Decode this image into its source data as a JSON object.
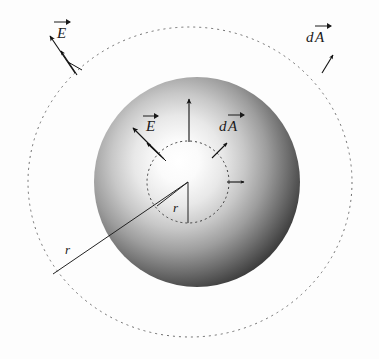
{
  "figure": {
    "type": "physics-diagram",
    "background_color": "#fdfdfd"
  },
  "labels": {
    "outer_E": "E",
    "outer_dA_d": "d",
    "outer_dA_A": "A",
    "inner_E": "E",
    "inner_dA_d": "d",
    "inner_dA_A": "A",
    "inner_radius": "r",
    "outer_radius": "r"
  },
  "shapes": {
    "charged_sphere": {
      "name": "charged-sphere",
      "center_x": 197,
      "center_y": 182,
      "radius_x": 103,
      "radius_y": 105,
      "fill_center_color": "#ffffff",
      "fill_edge_color": "#1c1c1c",
      "highlight_x": 176,
      "highlight_y": 172
    },
    "inner_gaussian_circle": {
      "name": "inner-gaussian-surface",
      "center_x": 188,
      "center_y": 182,
      "radius": 41,
      "stroke_color": "#3a3a3a",
      "dash": "2,3"
    },
    "outer_gaussian_circle": {
      "name": "outer-gaussian-surface",
      "center_x": 190,
      "center_y": 182,
      "radius_x": 162,
      "radius_y": 155,
      "stroke_color": "#6a6a6a",
      "dash": "2,4"
    }
  },
  "vectors": {
    "outer_E": {
      "name": "outer-electric-field-vector",
      "x1": 74,
      "y1": 72,
      "x2": 50,
      "y2": 36
    },
    "outer_dA": {
      "name": "outer-area-element-vector",
      "x1": 76,
      "y1": 74,
      "x2": 60,
      "y2": 50
    },
    "outer_dA_right": {
      "name": "outer-right-area-element-vector",
      "x1": 322,
      "y1": 72,
      "x2": 332,
      "y2": 56
    },
    "inner_E": {
      "name": "inner-electric-field-vector",
      "x1": 160,
      "y1": 155,
      "x2": 133,
      "y2": 127
    },
    "inner_dA": {
      "name": "inner-area-element-vector",
      "x1": 163,
      "y1": 158,
      "x2": 146,
      "y2": 142
    },
    "inner_top": {
      "name": "inner-top-field-vector",
      "x1": 189,
      "y1": 141,
      "x2": 189,
      "y2": 99
    },
    "inner_upper_right": {
      "name": "inner-upper-right-area-vector",
      "x1": 211,
      "y1": 157,
      "x2": 226,
      "y2": 142
    },
    "inner_right": {
      "name": "inner-right-area-vector",
      "x1": 227,
      "y1": 182,
      "x2": 243,
      "y2": 182
    }
  },
  "radius_lines": {
    "inner": {
      "name": "inner-radius-line",
      "x1": 188,
      "y1": 182,
      "x2": 188,
      "y2": 223
    },
    "inner_diagonal": {
      "name": "inner-radius-diagonal",
      "x1": 188,
      "y1": 182,
      "x2": 158,
      "y2": 205
    },
    "outer": {
      "name": "outer-radius-line",
      "x1": 188,
      "y1": 182,
      "x2": 53,
      "y2": 274
    }
  },
  "label_positions": {
    "outer_E": {
      "x": 57,
      "y": 35
    },
    "outer_dA": {
      "x": 310,
      "y": 45
    },
    "inner_E": {
      "x": 146,
      "y": 128
    },
    "inner_dA": {
      "x": 222,
      "y": 128
    },
    "inner_r": {
      "x": 174,
      "y": 208
    },
    "outer_r": {
      "x": 66,
      "y": 251
    }
  }
}
